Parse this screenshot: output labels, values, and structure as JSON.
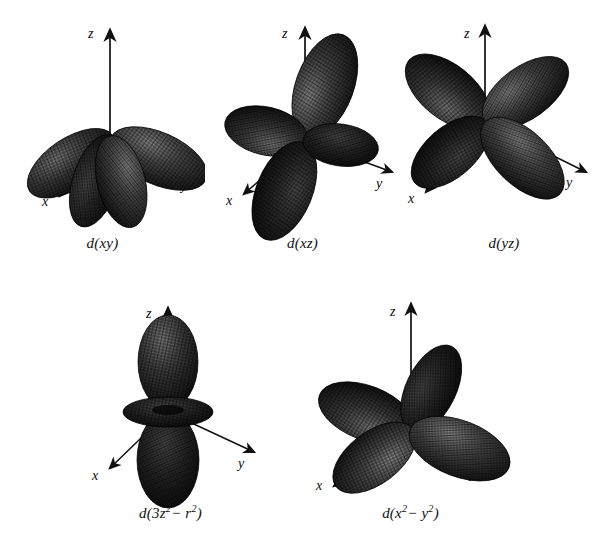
{
  "figure": {
    "background_color": "#ffffff",
    "lobe_color": "#2b2b2b",
    "lobe_highlight_color": "#6e6e6e",
    "lobe_shadow_color": "#0c0c0c",
    "mesh_color": "#0a0a0a",
    "axis_color": "#111111"
  },
  "axis_labels": {
    "x": "x",
    "y": "y",
    "z": "z"
  },
  "orbitals": [
    {
      "id": "dxy",
      "caption_prefix": "d(",
      "caption_body": "xy",
      "caption_suffix": ")",
      "row": 1,
      "column": 1,
      "lobe_count": 4,
      "plane": "xy",
      "has_torus": false
    },
    {
      "id": "dxz",
      "caption_prefix": "d(",
      "caption_body": "xz",
      "caption_suffix": ")",
      "row": 1,
      "column": 2,
      "lobe_count": 4,
      "plane": "xz",
      "has_torus": false
    },
    {
      "id": "dyz",
      "caption_prefix": "d(",
      "caption_body": "yz",
      "caption_suffix": ")",
      "row": 1,
      "column": 3,
      "lobe_count": 4,
      "plane": "yz",
      "has_torus": false
    },
    {
      "id": "dz2",
      "caption_prefix": "d(3",
      "caption_body": "z",
      "caption_sup1": "2",
      "caption_mid": "− r",
      "caption_sup2": "2",
      "caption_suffix": ")",
      "row": 2,
      "column": 1,
      "lobe_count": 2,
      "plane": "z",
      "has_torus": true
    },
    {
      "id": "dx2y2",
      "caption_prefix": "d(",
      "caption_body": "x",
      "caption_sup1": "2",
      "caption_mid": "− y",
      "caption_sup2": "2",
      "caption_suffix": ")",
      "row": 2,
      "column": 2,
      "lobe_count": 4,
      "plane": "xy-axes",
      "has_torus": false
    }
  ]
}
